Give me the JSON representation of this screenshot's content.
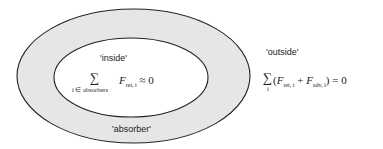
{
  "diagram": {
    "colors": {
      "ring_fill": "#e6e6e6",
      "inner_fill": "#ffffff",
      "stroke": "#222222"
    },
    "regions": {
      "inside": {
        "label": "'inside'"
      },
      "absorber": {
        "label": "'absorber'"
      },
      "outside": {
        "label": "'outside'"
      }
    },
    "equations": {
      "inside": {
        "sum_symbol": "∑",
        "sum_index": "i ∈ absorbers",
        "F": "F",
        "F_sub": "ret, i",
        "rhs": "≈ 0"
      },
      "outside": {
        "sum_symbol": "∑",
        "sum_index": "i",
        "open": "(",
        "F1": "F",
        "F1_sub": "ret, i",
        "plus": " + ",
        "F2": "F",
        "F2_sub": "adv, i",
        "close_rhs": ") = 0"
      }
    }
  }
}
